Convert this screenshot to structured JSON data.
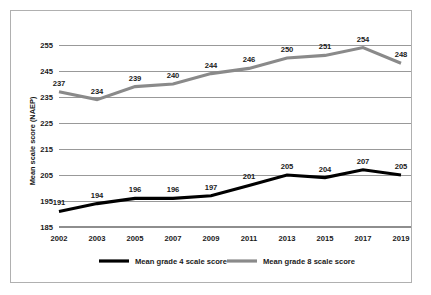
{
  "chart_data": {
    "type": "line",
    "title": "",
    "xlabel": "",
    "ylabel": "Mean scale score (NAEP)",
    "categories": [
      "2002",
      "2003",
      "2005",
      "2007",
      "2009",
      "2011",
      "2013",
      "2015",
      "2017",
      "2019"
    ],
    "ylim": [
      185,
      255
    ],
    "yticks": [
      185,
      195,
      205,
      215,
      225,
      235,
      245,
      255
    ],
    "grid": "horizontal",
    "legend_position": "bottom-center",
    "series": [
      {
        "name": "Mean grade 4 scale score",
        "color": "#000000",
        "values": [
          191,
          194,
          196,
          196,
          197,
          201,
          205,
          204,
          207,
          205
        ]
      },
      {
        "name": "Mean grade 8 scale score",
        "color": "#8a8a8a",
        "values": [
          237,
          234,
          239,
          240,
          244,
          246,
          250,
          251,
          254,
          248
        ]
      }
    ]
  },
  "axis": {
    "y_title": "Mean scale score (NAEP)",
    "y_tick_labels": [
      "255",
      "245",
      "235",
      "225",
      "215",
      "205",
      "195",
      "185"
    ],
    "x_tick_labels": [
      "2002",
      "2003",
      "2005",
      "2007",
      "2009",
      "2011",
      "2013",
      "2015",
      "2017",
      "2019"
    ]
  },
  "labels": {
    "grade4": [
      "191",
      "194",
      "196",
      "196",
      "197",
      "201",
      "205",
      "204",
      "207",
      "205"
    ],
    "grade8": [
      "237",
      "234",
      "239",
      "240",
      "244",
      "246",
      "250",
      "251",
      "254",
      "248"
    ]
  },
  "legend": {
    "items": [
      {
        "label": "Mean grade 4 scale score",
        "color": "#000000"
      },
      {
        "label": "Mean grade 8 scale score",
        "color": "#8a8a8a"
      }
    ]
  }
}
